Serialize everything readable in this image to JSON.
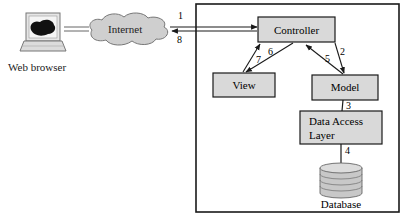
{
  "diagram": {
    "type": "MVC web architecture",
    "nodes": {
      "browser": {
        "label": "Web browser"
      },
      "internet": {
        "label": "Internet"
      },
      "controller": {
        "label": "Controller"
      },
      "view": {
        "label": "View"
      },
      "model": {
        "label": "Model"
      },
      "dal": {
        "label_line1": "Data Access",
        "label_line2": "Layer"
      },
      "database": {
        "label": "Database"
      }
    },
    "edges": [
      {
        "from": "internet",
        "to": "controller",
        "label": "1"
      },
      {
        "from": "controller",
        "to": "model",
        "label": "2"
      },
      {
        "from": "model",
        "to": "dal",
        "label": "3"
      },
      {
        "from": "dal",
        "to": "database",
        "label": "4"
      },
      {
        "from": "model",
        "to": "controller",
        "label": "5"
      },
      {
        "from": "controller",
        "to": "view",
        "label": "6"
      },
      {
        "from": "view",
        "to": "controller",
        "label": "7"
      },
      {
        "from": "controller",
        "to": "internet",
        "label": "8"
      }
    ],
    "colors": {
      "box_fill": "#d9d9d9",
      "stroke": "#1a1a1a",
      "cloud_fill": "#cfcfcf",
      "db_fill": "#c8c8c8"
    }
  }
}
